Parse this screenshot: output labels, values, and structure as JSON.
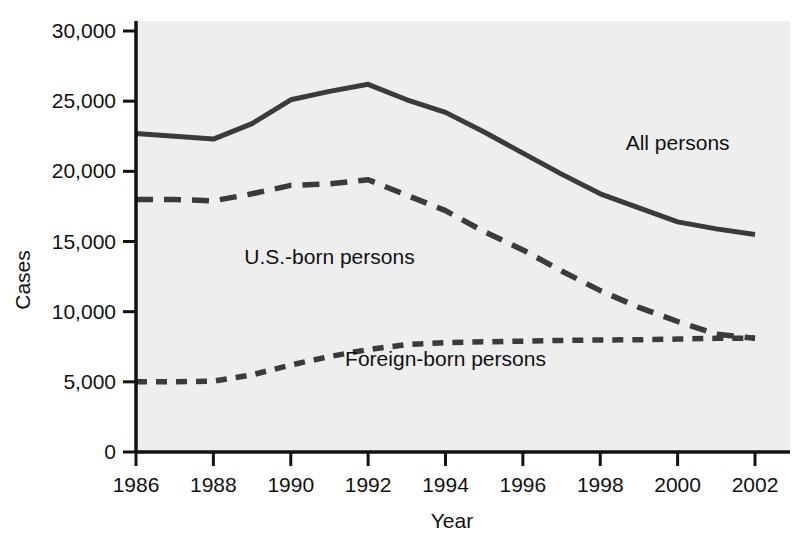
{
  "chart_data": {
    "type": "line",
    "title": "",
    "xlabel": "Year",
    "ylabel": "Cases",
    "xlim": [
      1986,
      2002
    ],
    "ylim": [
      0,
      30000
    ],
    "grid": false,
    "legend_position": "inline-annotations",
    "x": [
      1986,
      1987,
      1988,
      1989,
      1990,
      1991,
      1992,
      1993,
      1994,
      1995,
      1996,
      1997,
      1998,
      1999,
      2000,
      2001,
      2002
    ],
    "xtick_labels": [
      "1986",
      "1988",
      "1990",
      "1992",
      "1994",
      "1996",
      "1998",
      "2000",
      "2002"
    ],
    "xtick_values": [
      1986,
      1988,
      1990,
      1992,
      1994,
      1996,
      1998,
      2000,
      2002
    ],
    "ytick_labels": [
      "0",
      "5,000",
      "10,000",
      "15,000",
      "20,000",
      "25,000",
      "30,000"
    ],
    "ytick_values": [
      0,
      5000,
      10000,
      15000,
      20000,
      25000,
      30000
    ],
    "series": [
      {
        "name": "All persons",
        "style": "solid",
        "color": "#3b3b3b",
        "label_x": 2000,
        "label_y": 21500,
        "values": [
          22700,
          22500,
          22300,
          23400,
          25100,
          25700,
          26200,
          25100,
          24200,
          22800,
          21300,
          19800,
          18400,
          17400,
          16400,
          15900,
          15500
        ]
      },
      {
        "name": "U.S.-born persons",
        "style": "dashed",
        "color": "#3b3b3b",
        "label_x": 1991,
        "label_y": 13400,
        "values": [
          18000,
          18000,
          17900,
          18400,
          19000,
          19100,
          19400,
          18300,
          17200,
          15700,
          14400,
          12900,
          11500,
          10300,
          9300,
          8400,
          8100
        ]
      },
      {
        "name": "Foreign-born persons",
        "style": "dotted",
        "color": "#3b3b3b",
        "label_x": 1994,
        "label_y": 6100,
        "values": [
          5000,
          5000,
          5050,
          5500,
          6200,
          6800,
          7300,
          7650,
          7800,
          7850,
          7900,
          7950,
          7980,
          8000,
          8050,
          8100,
          8100
        ]
      }
    ]
  },
  "figure": {
    "plot_background": "#eeeeee",
    "axis_color": "#111111",
    "caption_fragment": ""
  }
}
